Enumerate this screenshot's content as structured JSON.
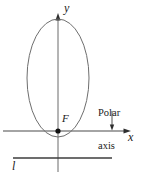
{
  "figure": {
    "background_color": "#ffffff",
    "stroke_color": "#595959",
    "axis_color": "#4d4d4d",
    "text_color": "#1a1a1a",
    "labels": {
      "y_axis": "y",
      "x_axis": "x",
      "focus": "F",
      "directrix": "l",
      "polar_axis_line1": "Polar",
      "polar_axis_line2": "axis"
    },
    "geometry": {
      "origin": {
        "x": 58,
        "y": 131
      },
      "ellipse": {
        "center_x": 58,
        "center_y": 78,
        "radius_x": 31,
        "radius_y": 59
      },
      "x_axis": {
        "x1": 3,
        "y1": 131,
        "x2": 130,
        "y2": 131
      },
      "y_axis": {
        "x1": 58,
        "y1": 16,
        "x2": 58,
        "y2": 172
      },
      "directrix": {
        "x1": 13,
        "y1": 158,
        "x2": 112,
        "y2": 158
      },
      "polar_axis_pointer": {
        "x": 112,
        "y1": 112,
        "y2": 129
      }
    }
  }
}
